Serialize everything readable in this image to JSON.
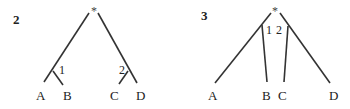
{
  "diagrams": [
    {
      "number": "2",
      "root": "*",
      "leaves": [
        "A",
        "B",
        "C",
        "D"
      ],
      "internal_labels": [
        "1",
        "2"
      ],
      "structure": "((A,B)1,(C,D)2)*"
    },
    {
      "number": "3",
      "root": "*",
      "leaves": [
        "A",
        "B",
        "C",
        "D"
      ],
      "internal_labels": [
        "1",
        "2"
      ],
      "structure": "(A,B,C,D)* with edge labels 1 (B) and 2 (C)"
    }
  ]
}
